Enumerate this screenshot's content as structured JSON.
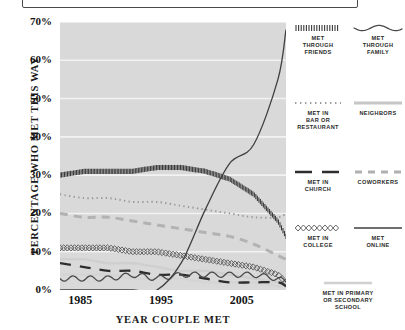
{
  "chart": {
    "type": "line",
    "ylabel": "PERCENTAGE WHO MET THIS WAY",
    "xlabel": "YEAR COUPLE MET",
    "yticks": [
      "0%",
      "10%",
      "20%",
      "30%",
      "40%",
      "50%",
      "60%",
      "70%"
    ],
    "xticks": [
      "1985",
      "1995",
      "2005"
    ],
    "ylim": [
      0,
      70
    ],
    "xlim": [
      1982,
      2010
    ],
    "grid": "horizontal-white",
    "plot_bg": "#d9d9d9"
  },
  "legend": {
    "items": [
      {
        "id": "met-through-friends",
        "label": "MET\nTHROUGH\nFRIENDS",
        "style": "dense-hatch",
        "color": "#3a3a3a"
      },
      {
        "id": "met-through-family",
        "label": "MET\nTHROUGH\nFAMILY",
        "style": "wavy",
        "color": "#4a4a4a"
      },
      {
        "id": "met-in-bar-or-restaurant",
        "label": "MET IN\nBAR OR\nRESTAURANT",
        "style": "fine-dotted",
        "color": "#9a9a9a"
      },
      {
        "id": "neighbors",
        "label": "NEIGHBORS",
        "style": "solid-light",
        "color": "#c6c6c6"
      },
      {
        "id": "met-in-church",
        "label": "MET IN\nCHURCH",
        "style": "long-dash-dark",
        "color": "#2e2e2e"
      },
      {
        "id": "coworkers",
        "label": "COWORKERS",
        "style": "short-dash-gray",
        "color": "#b0b0b0"
      },
      {
        "id": "met-in-college",
        "label": "MET IN\nCOLLEGE",
        "style": "diamond-chain",
        "color": "#555555"
      },
      {
        "id": "met-online",
        "label": "MET\nONLINE",
        "style": "solid-thin",
        "color": "#3f3f3f"
      },
      {
        "id": "met-in-primary-or-secondary-school",
        "label": "MET IN PRIMARY\nOR SECONDARY\nSCHOOL",
        "style": "solid-pale",
        "color": "#d0d0d0"
      }
    ]
  },
  "chart_data": {
    "type": "line",
    "title": "",
    "xlabel": "YEAR COUPLE MET",
    "ylabel": "PERCENTAGE WHO MET THIS WAY",
    "ylim": [
      0,
      70
    ],
    "xlim": [
      1982,
      2010
    ],
    "yticks": [
      0,
      10,
      20,
      30,
      40,
      50,
      60,
      70
    ],
    "xticks": [
      1985,
      1995,
      2005
    ],
    "grid": true,
    "legend_position": "right",
    "x": [
      1982,
      1985,
      1988,
      1991,
      1994,
      1997,
      2000,
      2003,
      2006,
      2009,
      2010
    ],
    "series": [
      {
        "name": "MET THROUGH FRIENDS",
        "style": "dense-hatch",
        "values": [
          30,
          31,
          31,
          31,
          32,
          32,
          31,
          29,
          25,
          18,
          14
        ]
      },
      {
        "name": "MET THROUGH FAMILY",
        "style": "wavy",
        "values": [
          3,
          3,
          3,
          4,
          3,
          4,
          4,
          4,
          4,
          3,
          2
        ]
      },
      {
        "name": "MET IN BAR OR RESTAURANT",
        "style": "fine-dotted",
        "values": [
          25,
          24,
          24,
          23,
          23,
          22,
          21,
          20,
          19,
          19,
          20
        ]
      },
      {
        "name": "NEIGHBORS",
        "style": "solid-light",
        "values": [
          8,
          8,
          7,
          7,
          6,
          5,
          5,
          4,
          3,
          2,
          2
        ]
      },
      {
        "name": "MET IN CHURCH",
        "style": "long-dash-dark",
        "values": [
          7,
          6,
          5,
          5,
          4,
          4,
          3,
          2,
          2,
          2,
          1
        ]
      },
      {
        "name": "COWORKERS",
        "style": "short-dash-gray",
        "values": [
          20,
          19,
          19,
          18,
          17,
          16,
          15,
          14,
          12,
          9,
          8
        ]
      },
      {
        "name": "MET IN COLLEGE",
        "style": "diamond-chain",
        "values": [
          11,
          11,
          11,
          10,
          10,
          9,
          8,
          7,
          6,
          4,
          2
        ]
      },
      {
        "name": "MET ONLINE",
        "style": "solid-thin",
        "values": [
          0,
          0,
          0,
          0,
          0,
          7,
          21,
          33,
          38,
          55,
          68
        ]
      },
      {
        "name": "MET IN PRIMARY OR SECONDARY SCHOOL",
        "style": "solid-pale",
        "values": [
          4,
          4,
          4,
          3,
          3,
          3,
          2,
          2,
          2,
          1,
          1
        ]
      }
    ]
  }
}
